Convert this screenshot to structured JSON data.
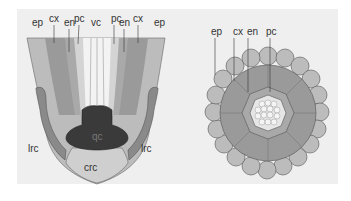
{
  "figure": {
    "panels": [
      {
        "name": "root-tip-longitudinal-section",
        "labels": {
          "ep_left": "ep",
          "cx_left": "cx",
          "en_left": "en",
          "pc_left": "pc",
          "vc": "vc",
          "pc_right": "pc",
          "en_right": "en",
          "cx_right": "cx",
          "ep_right": "ep",
          "qc": "qc",
          "lrc_left": "lrc",
          "lrc_right": "lrc",
          "crc": "crc"
        }
      },
      {
        "name": "root-cross-section",
        "labels": {
          "ep": "ep",
          "cx": "cx",
          "en": "en",
          "pc": "pc"
        }
      }
    ],
    "colors": {
      "background": "#efefef",
      "epidermis": "#bcbcbc",
      "cortex": "#9a9a9a",
      "endodermis": "#a8a8a8",
      "pericycle": "#d2d2d2",
      "vascular": "#ececec",
      "quiescent_center": "#3a3a3a",
      "lateral_root_cap": "#8a8a8a",
      "columella": "#cfcfcf",
      "outline": "#555555"
    }
  }
}
